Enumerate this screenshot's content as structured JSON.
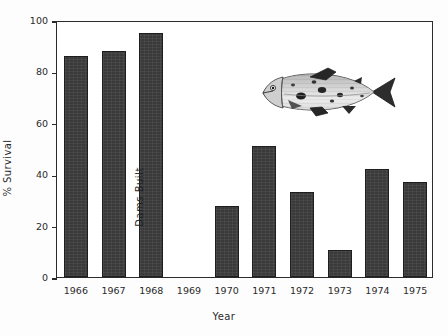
{
  "chart_data": {
    "type": "bar",
    "title": "",
    "subtitle": "",
    "xlabel": "Year",
    "ylabel": "% Survival",
    "categories": [
      "1966",
      "1967",
      "1968",
      "1969",
      "1970",
      "1971",
      "1972",
      "1973",
      "1974",
      "1975"
    ],
    "values": [
      86,
      88,
      95,
      null,
      27.5,
      51,
      33,
      10.5,
      42,
      37
    ],
    "ylim": [
      0,
      100
    ],
    "y_ticks": [
      0,
      20,
      40,
      60,
      80,
      100
    ],
    "y_tick_labels": [
      "0",
      "20",
      "40",
      "60",
      "80",
      "100"
    ],
    "grid": false,
    "legend": "none",
    "bar_color": "#3a3a3a",
    "axis_color": "#2b2b2b",
    "annotations": [
      {
        "text": "Dams Built",
        "category": "1969",
        "orientation": "vertical"
      }
    ],
    "illustration": {
      "name": "salmon-fish",
      "description": "Salmon illustration facing left"
    }
  },
  "axes": {
    "y_title": "% Survival",
    "x_title": "Year"
  },
  "annotation": {
    "dams_built": "Dams Built"
  }
}
